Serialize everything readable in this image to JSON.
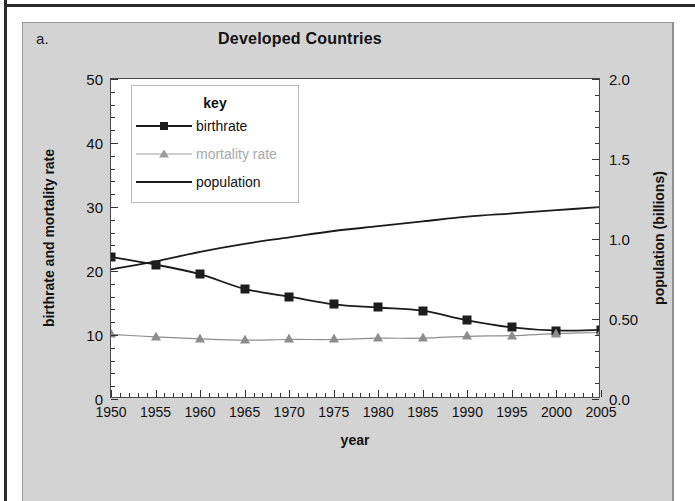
{
  "figure": {
    "panel_letter": "a.",
    "title": "Developed Countries"
  },
  "legend": {
    "title": "key",
    "entries": [
      {
        "label": "birthrate",
        "marker": "square",
        "color": "#1b1b1b"
      },
      {
        "label": "mortality rate",
        "marker": "triangle",
        "color": "#a9a9a9"
      },
      {
        "label": "population",
        "marker": "line",
        "color": "#1b1b1b"
      }
    ]
  },
  "axes": {
    "x": {
      "label": "year",
      "ticks": [
        "1950",
        "1955",
        "1960",
        "1965",
        "1970",
        "1975",
        "1980",
        "1985",
        "1990",
        "1995",
        "2000",
        "2005"
      ],
      "min": 1950,
      "max": 2005,
      "minor_per_major": 5
    },
    "y_left": {
      "label": "birthrate and mortality rate",
      "ticks": [
        "0",
        "10",
        "20",
        "30",
        "40",
        "50"
      ],
      "min": 0,
      "max": 50,
      "minor_per_major": 5
    },
    "y_right": {
      "label": "population (billions)",
      "ticks": [
        "0.0",
        "0.50",
        "1.0",
        "1.5",
        "2.0"
      ],
      "min": 0,
      "max": 2.0,
      "minor_per_major": 5
    }
  },
  "chart_data": {
    "type": "line",
    "title": "Developed Countries",
    "xlabel": "year",
    "ylabel": "birthrate and mortality rate",
    "y2label": "population (billions)",
    "xlim": [
      1950,
      2005
    ],
    "ylim": [
      0,
      50
    ],
    "y2lim": [
      0,
      2.0
    ],
    "grid": false,
    "legend_position": "inside-top-left",
    "x": [
      1950,
      1955,
      1960,
      1965,
      1970,
      1975,
      1980,
      1985,
      1990,
      1995,
      2000,
      2005
    ],
    "series": [
      {
        "name": "birthrate",
        "axis": "left",
        "marker": "square",
        "color": "#1b1b1b",
        "values": [
          22.2,
          21.0,
          19.5,
          17.2,
          16.0,
          14.8,
          14.3,
          13.8,
          12.3,
          11.2,
          10.7,
          10.8
        ]
      },
      {
        "name": "mortality rate",
        "axis": "left",
        "marker": "triangle",
        "color": "#8d8d8d",
        "values": [
          10.1,
          9.7,
          9.4,
          9.2,
          9.3,
          9.3,
          9.5,
          9.5,
          9.8,
          9.9,
          10.2,
          10.4
        ]
      },
      {
        "name": "population",
        "axis": "right",
        "marker": "none",
        "color": "#1b1b1b",
        "values": [
          0.81,
          0.86,
          0.92,
          0.97,
          1.01,
          1.05,
          1.08,
          1.11,
          1.14,
          1.16,
          1.18,
          1.2
        ]
      }
    ]
  }
}
